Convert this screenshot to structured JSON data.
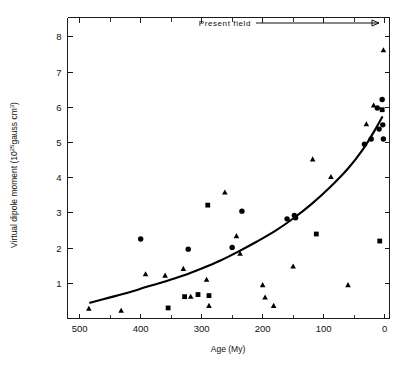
{
  "figure": {
    "background_color": "#ffffff",
    "ink_color": "#000000"
  },
  "annotations": {
    "present_field_label": "Present field",
    "present_field_arrow": "arrow-right"
  },
  "axes": {
    "x": {
      "title": "Age (My)",
      "tick_labels": [
        "500",
        "400",
        "300",
        "200",
        "100",
        "0"
      ],
      "tick_values": [
        500,
        400,
        300,
        200,
        100,
        0
      ],
      "minor_tick_values": [
        450,
        350,
        250,
        150,
        50
      ],
      "reversed": true
    },
    "y": {
      "title_main": "Virtual dipole moment (10",
      "title_exp": "25",
      "title_tail": "gauss cm",
      "title_tail_exp": "3",
      "title_close": ")",
      "tick_labels": [
        "1",
        "2",
        "3",
        "4",
        "5",
        "6",
        "7",
        "8"
      ],
      "tick_values": [
        1,
        2,
        3,
        4,
        5,
        6,
        7,
        8
      ]
    }
  },
  "caption": {
    "cut_off_text": ""
  },
  "chart_data": {
    "type": "scatter",
    "title": "",
    "xlabel": "Age (My)",
    "ylabel": "Virtual dipole moment (10^25 gauss cm^3)",
    "xlim": [
      520,
      -8
    ],
    "ylim": [
      0,
      8.55
    ],
    "x_reversed": true,
    "grid": false,
    "legend": "none",
    "annotations": [
      {
        "text": "Present field",
        "x": 105,
        "y": 8.25,
        "arrow_to_x": 8,
        "arrow_to_y": 8.25
      }
    ],
    "series": [
      {
        "name": "circle-markers",
        "marker": "circle",
        "points": [
          {
            "x": 400,
            "y": 2.26
          },
          {
            "x": 322,
            "y": 1.97
          },
          {
            "x": 250,
            "y": 2.02
          },
          {
            "x": 234,
            "y": 3.05
          },
          {
            "x": 160,
            "y": 2.83
          },
          {
            "x": 148,
            "y": 2.93
          },
          {
            "x": 146,
            "y": 2.86
          },
          {
            "x": 33,
            "y": 4.95
          },
          {
            "x": 22,
            "y": 5.1
          },
          {
            "x": 12,
            "y": 5.98
          },
          {
            "x": 9,
            "y": 5.38
          },
          {
            "x": 4,
            "y": 6.22
          },
          {
            "x": 3,
            "y": 5.5
          },
          {
            "x": 2,
            "y": 5.1
          }
        ]
      },
      {
        "name": "square-markers",
        "marker": "square",
        "points": [
          {
            "x": 355,
            "y": 0.3
          },
          {
            "x": 328,
            "y": 0.62
          },
          {
            "x": 306,
            "y": 0.68
          },
          {
            "x": 290,
            "y": 3.22
          },
          {
            "x": 288,
            "y": 0.65
          },
          {
            "x": 112,
            "y": 2.4
          },
          {
            "x": 8,
            "y": 2.2
          },
          {
            "x": 4,
            "y": 5.93
          }
        ]
      },
      {
        "name": "triangle-markers",
        "marker": "triangle",
        "points": [
          {
            "x": 485,
            "y": 0.28
          },
          {
            "x": 432,
            "y": 0.22
          },
          {
            "x": 392,
            "y": 1.26
          },
          {
            "x": 360,
            "y": 1.22
          },
          {
            "x": 330,
            "y": 1.41
          },
          {
            "x": 318,
            "y": 0.62
          },
          {
            "x": 292,
            "y": 1.1
          },
          {
            "x": 288,
            "y": 0.36
          },
          {
            "x": 262,
            "y": 3.58
          },
          {
            "x": 243,
            "y": 2.34
          },
          {
            "x": 237,
            "y": 1.84
          },
          {
            "x": 200,
            "y": 0.95
          },
          {
            "x": 196,
            "y": 0.6
          },
          {
            "x": 182,
            "y": 0.36
          },
          {
            "x": 150,
            "y": 1.48
          },
          {
            "x": 118,
            "y": 4.52
          },
          {
            "x": 88,
            "y": 4.02
          },
          {
            "x": 60,
            "y": 0.95
          },
          {
            "x": 30,
            "y": 5.52
          },
          {
            "x": 18,
            "y": 6.05
          },
          {
            "x": 2,
            "y": 7.62
          }
        ]
      }
    ],
    "fit_curve": {
      "name": "dipole-moment-fit",
      "style": "solid",
      "points": [
        {
          "x": 483,
          "y": 0.45
        },
        {
          "x": 450,
          "y": 0.6
        },
        {
          "x": 420,
          "y": 0.74
        },
        {
          "x": 390,
          "y": 0.9
        },
        {
          "x": 360,
          "y": 1.05
        },
        {
          "x": 330,
          "y": 1.22
        },
        {
          "x": 300,
          "y": 1.42
        },
        {
          "x": 270,
          "y": 1.64
        },
        {
          "x": 240,
          "y": 1.9
        },
        {
          "x": 210,
          "y": 2.18
        },
        {
          "x": 180,
          "y": 2.48
        },
        {
          "x": 150,
          "y": 2.84
        },
        {
          "x": 120,
          "y": 3.25
        },
        {
          "x": 90,
          "y": 3.72
        },
        {
          "x": 60,
          "y": 4.26
        },
        {
          "x": 35,
          "y": 4.82
        },
        {
          "x": 15,
          "y": 5.38
        },
        {
          "x": 4,
          "y": 5.72
        }
      ]
    }
  }
}
